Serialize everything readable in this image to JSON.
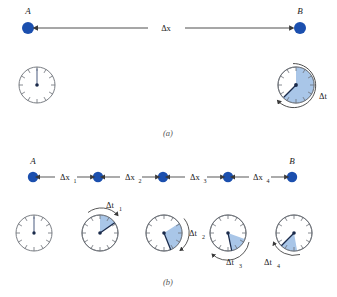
{
  "figure": {
    "panels": [
      {
        "id": "a",
        "caption": "(a)",
        "points": [
          {
            "name": "A",
            "label": "A",
            "x": 28,
            "y": 28
          },
          {
            "name": "B",
            "label": "B",
            "x": 300,
            "y": 28
          }
        ],
        "displacement_label": "Δx",
        "clocks": [
          {
            "name": "clock-a-start",
            "cx": 37,
            "cy": 85,
            "r": 18,
            "hand_angle_deg": 0,
            "sector_start_deg": 0,
            "sector_sweep_deg": 0,
            "arrow": false,
            "time_label": ""
          },
          {
            "name": "clock-a-end",
            "cx": 296,
            "cy": 85,
            "r": 18,
            "hand_angle_deg": 225,
            "sector_start_deg": 0,
            "sector_sweep_deg": 225,
            "arrow": true,
            "time_label": "Δt"
          }
        ]
      },
      {
        "id": "b",
        "caption": "(b)",
        "points": [
          {
            "name": "A",
            "label": "A",
            "x": 33,
            "y": 177
          },
          {
            "name": "p1",
            "label": "",
            "x": 98,
            "y": 177
          },
          {
            "name": "p2",
            "label": "",
            "x": 163,
            "y": 177
          },
          {
            "name": "p3",
            "label": "",
            "x": 228,
            "y": 177
          },
          {
            "name": "B",
            "label": "B",
            "x": 292,
            "y": 177
          }
        ],
        "interval_labels": [
          "Δx",
          "Δx",
          "Δx",
          "Δx"
        ],
        "interval_subscripts": [
          "1",
          "2",
          "3",
          "4"
        ],
        "clocks": [
          {
            "name": "clock-b-0",
            "cx": 34,
            "cy": 233,
            "r": 18,
            "hand_angle_deg": 0,
            "sector_start_deg": 0,
            "sector_sweep_deg": 0,
            "arrow": false,
            "time_label": "",
            "time_sub": ""
          },
          {
            "name": "clock-b-1",
            "cx": 100,
            "cy": 233,
            "r": 18,
            "hand_angle_deg": 55,
            "sector_start_deg": 0,
            "sector_sweep_deg": 55,
            "arrow": true,
            "time_label": "Δt",
            "time_sub": "1"
          },
          {
            "name": "clock-b-2",
            "cx": 164,
            "cy": 233,
            "r": 18,
            "hand_angle_deg": 112,
            "sector_start_deg": 57,
            "sector_sweep_deg": 55,
            "arrow": true,
            "time_label": "Δt",
            "time_sub": "2"
          },
          {
            "name": "clock-b-3",
            "cx": 228,
            "cy": 233,
            "r": 18,
            "hand_angle_deg": 168,
            "sector_start_deg": 113,
            "sector_sweep_deg": 55,
            "arrow": true,
            "time_label": "Δt",
            "time_sub": "3"
          },
          {
            "name": "clock-b-4",
            "cx": 294,
            "cy": 233,
            "r": 18,
            "hand_angle_deg": 225,
            "sector_start_deg": 170,
            "sector_sweep_deg": 55,
            "arrow": true,
            "time_label": "Δt",
            "time_sub": "4"
          }
        ]
      }
    ],
    "colors": {
      "dot": "#1b4fae",
      "sector_fill": "#a9c6e8",
      "clock_stroke": "#6b6f76",
      "line": "#3a3a3a",
      "hand": "#1a2a4a",
      "text": "#1a1a1a"
    }
  }
}
